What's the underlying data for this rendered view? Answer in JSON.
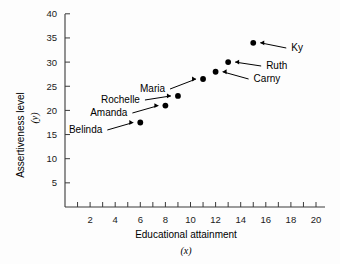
{
  "chart_data": {
    "type": "scatter",
    "title": "",
    "xlabel": "Educational attainment",
    "xlabel_var": "(x)",
    "ylabel": "Assertiveness level",
    "ylabel_var": "(y)",
    "xlim": [
      0,
      21
    ],
    "ylim": [
      0,
      42
    ],
    "x_tick_step": 1,
    "x_label_step": 2,
    "xticks": [
      2,
      4,
      6,
      8,
      10,
      12,
      14,
      16,
      18,
      20
    ],
    "xticks_all": [
      1,
      2,
      3,
      4,
      5,
      6,
      7,
      8,
      9,
      10,
      11,
      12,
      13,
      14,
      15,
      16,
      17,
      18,
      19,
      20,
      21
    ],
    "yticks": [
      5,
      10,
      15,
      20,
      25,
      30,
      35,
      40
    ],
    "grid": false,
    "legend": "none",
    "marker": "filled-circle",
    "marker_color": "#000000",
    "points": [
      {
        "name": "Belinda",
        "x": 6,
        "y": 17.5,
        "label_side": "left"
      },
      {
        "name": "Amanda",
        "x": 8,
        "y": 21.0,
        "label_side": "left"
      },
      {
        "name": "Rochelle",
        "x": 9,
        "y": 23.0,
        "label_side": "left"
      },
      {
        "name": "Maria",
        "x": 11,
        "y": 26.5,
        "label_side": "left"
      },
      {
        "name": "Carny",
        "x": 12,
        "y": 28.0,
        "label_side": "right"
      },
      {
        "name": "Ruth",
        "x": 13,
        "y": 30.0,
        "label_side": "right"
      },
      {
        "name": "Ky",
        "x": 15,
        "y": 34.0,
        "label_side": "right"
      }
    ]
  },
  "tick_labels": {
    "x": [
      "2",
      "4",
      "6",
      "8",
      "10",
      "12",
      "14",
      "16",
      "18",
      "20"
    ],
    "y": [
      "5",
      "10",
      "15",
      "20",
      "25",
      "30",
      "35",
      "40"
    ]
  },
  "annotations": {
    "belinda": "Belinda",
    "amanda": "Amanda",
    "rochelle": "Rochelle",
    "maria": "Maria",
    "carny": "Carny",
    "ruth": "Ruth",
    "ky": "Ky"
  }
}
